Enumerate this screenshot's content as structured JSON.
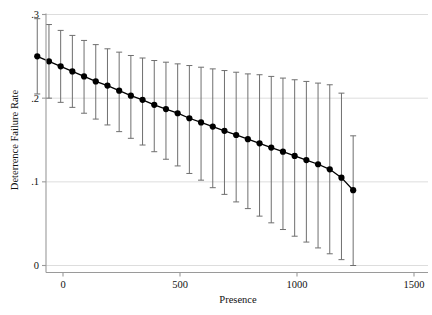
{
  "chart_data": {
    "type": "line",
    "title": "",
    "subtitle": "",
    "xlabel": "Presence",
    "ylabel": "Deterrence Failure Rate",
    "xlim": [
      -250,
      1500
    ],
    "ylim": [
      0,
      0.3
    ],
    "xticks": [
      0,
      500,
      1000,
      1500
    ],
    "xtick_labels": [
      "0",
      "500",
      "1000",
      "1500"
    ],
    "yticks": [
      0,
      0.1,
      0.2,
      0.3
    ],
    "ytick_labels": [
      "0",
      ".1",
      ".2",
      ".3"
    ],
    "grid": "horizontal",
    "legend": "none",
    "annotations": [],
    "series": [
      {
        "name": "Deterrence Failure Rate",
        "marker": "filled-circle",
        "color": "#000000",
        "error_bar_color": "#6f6f6f",
        "error_bar_style": "capped-vertical",
        "x": [
          -110,
          -60,
          -10,
          40,
          90,
          140,
          190,
          240,
          290,
          340,
          390,
          440,
          490,
          540,
          590,
          640,
          690,
          740,
          790,
          840,
          890,
          940,
          990,
          1040,
          1090,
          1140,
          1190,
          1240
        ],
        "values": [
          0.25,
          0.244,
          0.238,
          0.232,
          0.226,
          0.22,
          0.215,
          0.209,
          0.203,
          0.198,
          0.192,
          0.187,
          0.182,
          0.176,
          0.171,
          0.166,
          0.161,
          0.156,
          0.151,
          0.146,
          0.141,
          0.136,
          0.131,
          0.126,
          0.121,
          0.115,
          0.105,
          0.09
        ],
        "ci_lower": [
          0.205,
          0.2,
          0.195,
          0.189,
          0.182,
          0.175,
          0.168,
          0.16,
          0.152,
          0.144,
          0.136,
          0.127,
          0.119,
          0.11,
          0.102,
          0.093,
          0.085,
          0.076,
          0.068,
          0.059,
          0.051,
          0.043,
          0.035,
          0.028,
          0.021,
          0.014,
          0.007,
          0.0
        ],
        "ci_upper": [
          0.295,
          0.288,
          0.281,
          0.275,
          0.269,
          0.264,
          0.259,
          0.255,
          0.251,
          0.248,
          0.245,
          0.243,
          0.241,
          0.239,
          0.237,
          0.235,
          0.233,
          0.231,
          0.229,
          0.228,
          0.226,
          0.224,
          0.222,
          0.22,
          0.218,
          0.216,
          0.206,
          0.155
        ]
      }
    ]
  }
}
